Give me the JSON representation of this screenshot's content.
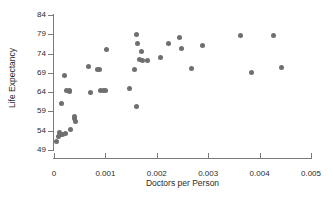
{
  "chart_data": {
    "type": "scatter",
    "title": "",
    "xlabel": "Doctors per Person",
    "ylabel": "Life Expectancy",
    "xlim": [
      0,
      0.005
    ],
    "ylim": [
      49,
      84
    ],
    "xticks": [
      "0",
      "0.001",
      "0.002",
      "0.003",
      "0.004",
      "0.005"
    ],
    "xtick_values": [
      0,
      0.001,
      0.002,
      0.003,
      0.004,
      0.005
    ],
    "yticks": [
      "49",
      "54",
      "59",
      "64",
      "69",
      "74",
      "79",
      "84"
    ],
    "ytick_values": [
      49,
      54,
      59,
      64,
      69,
      74,
      79,
      84
    ],
    "grid": false,
    "legend": null,
    "marker_color": "#6f6f6f",
    "axis_color": "#7a7a7a",
    "points": [
      {
        "x": 5e-05,
        "y": 51.3
      },
      {
        "x": 8e-05,
        "y": 52.4
      },
      {
        "x": 0.0001,
        "y": 53.6
      },
      {
        "x": 0.00013,
        "y": 53.0
      },
      {
        "x": 0.00016,
        "y": 53.1
      },
      {
        "x": 0.00022,
        "y": 53.2
      },
      {
        "x": 0.00014,
        "y": 61.0
      },
      {
        "x": 0.0002,
        "y": 68.4
      },
      {
        "x": 0.00024,
        "y": 64.3
      },
      {
        "x": 0.0003,
        "y": 64.5
      },
      {
        "x": 0.00031,
        "y": 64.1
      },
      {
        "x": 0.00033,
        "y": 54.4
      },
      {
        "x": 0.00039,
        "y": 57.1
      },
      {
        "x": 0.0004,
        "y": 57.6
      },
      {
        "x": 0.00042,
        "y": 56.3
      },
      {
        "x": 0.00068,
        "y": 70.7
      },
      {
        "x": 0.00071,
        "y": 63.9
      },
      {
        "x": 0.00085,
        "y": 69.8
      },
      {
        "x": 0.00089,
        "y": 69.8
      },
      {
        "x": 0.00091,
        "y": 64.3
      },
      {
        "x": 0.00097,
        "y": 64.3
      },
      {
        "x": 0.001,
        "y": 64.3
      },
      {
        "x": 0.00102,
        "y": 75.0
      },
      {
        "x": 0.00146,
        "y": 64.9
      },
      {
        "x": 0.00157,
        "y": 69.8
      },
      {
        "x": 0.0016,
        "y": 79.0
      },
      {
        "x": 0.00161,
        "y": 60.4
      },
      {
        "x": 0.00163,
        "y": 76.5
      },
      {
        "x": 0.00166,
        "y": 72.4
      },
      {
        "x": 0.0017,
        "y": 74.6
      },
      {
        "x": 0.00172,
        "y": 72.3
      },
      {
        "x": 0.00182,
        "y": 72.3
      },
      {
        "x": 0.00207,
        "y": 73.1
      },
      {
        "x": 0.00223,
        "y": 76.5
      },
      {
        "x": 0.00245,
        "y": 78.2
      },
      {
        "x": 0.00248,
        "y": 75.4
      },
      {
        "x": 0.00268,
        "y": 70.1
      },
      {
        "x": 0.00288,
        "y": 76.1
      },
      {
        "x": 0.00362,
        "y": 78.6
      },
      {
        "x": 0.00385,
        "y": 69.0
      },
      {
        "x": 0.00428,
        "y": 78.6
      },
      {
        "x": 0.00443,
        "y": 70.4
      }
    ]
  }
}
